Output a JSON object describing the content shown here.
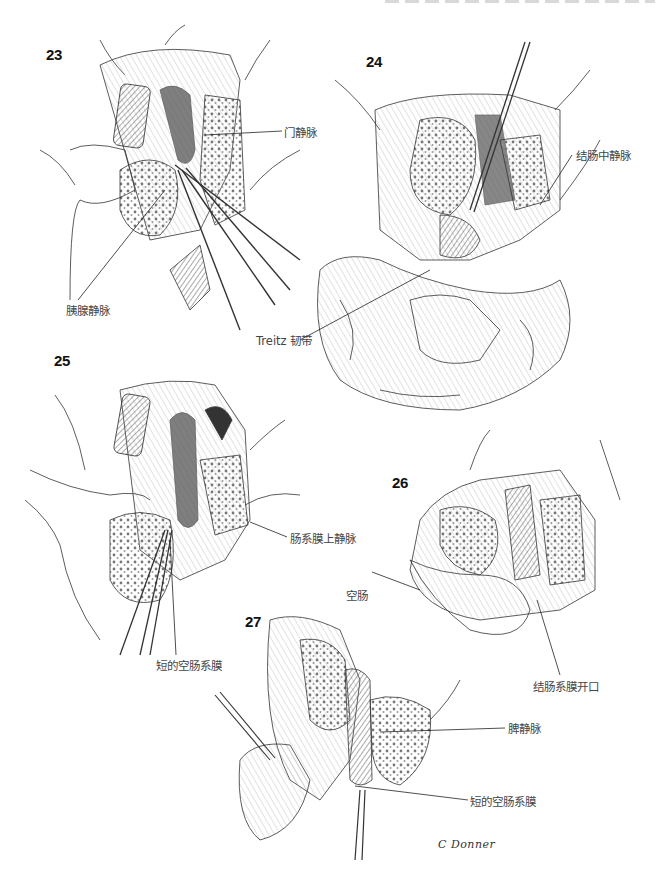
{
  "page": {
    "header_text": "",
    "figures": [
      {
        "number": "23",
        "labels": [
          "门静脉",
          "胰腺静脉"
        ]
      },
      {
        "number": "24",
        "labels": [
          "结肠中静脉",
          "Treitz 韧带"
        ]
      },
      {
        "number": "25",
        "labels": [
          "肠系膜上静脉",
          "短的空肠系膜"
        ]
      },
      {
        "number": "26",
        "labels": [
          "空肠",
          "结肠系膜开口"
        ]
      },
      {
        "number": "27",
        "labels": [
          "脾静脉",
          "短的空肠系膜"
        ]
      }
    ],
    "signature": "C Donner"
  },
  "fig23": {
    "number": "23",
    "label_portal_vein": "门静脉",
    "label_pancreatic_vein": "胰腺静脉"
  },
  "fig24": {
    "number": "24",
    "label_middle_colic_vein": "结肠中静脉",
    "label_treitz": "Treitz 韧带"
  },
  "fig25": {
    "number": "25",
    "label_smv": "肠系膜上静脉",
    "label_short_mesentery": "短的空肠系膜"
  },
  "fig26": {
    "number": "26",
    "label_jejunum": "空肠",
    "label_mesocolon_opening": "结肠系膜开口"
  },
  "fig27": {
    "number": "27",
    "label_splenic_vein": "脾静脉",
    "label_short_mesentery": "短的空肠系膜"
  },
  "signature": "C Donner",
  "colors": {
    "ink": "#222222",
    "label": "#444444",
    "background": "#ffffff",
    "hatch": "#9a9a9a"
  }
}
